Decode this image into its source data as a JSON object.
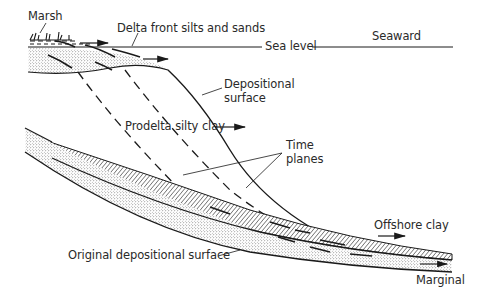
{
  "diagram": {
    "type": "geologic cross-section of delta progradation",
    "labels": {
      "marsh": "Marsh",
      "delta_front": "Delta front silts and sands",
      "sea_level": "Sea level",
      "seaward": "Seaward",
      "depositional_surface_1": "Depositional",
      "depositional_surface_2": "surface",
      "prodelta": "Prodelta silty clay",
      "time_planes_1": "Time",
      "time_planes_2": "planes",
      "offshore": "Offshore clay",
      "original_surface": "Original depositional surface",
      "marginal": "Marginal"
    },
    "colors": {
      "ink": "#1a1a1a",
      "background": "#ffffff"
    }
  }
}
